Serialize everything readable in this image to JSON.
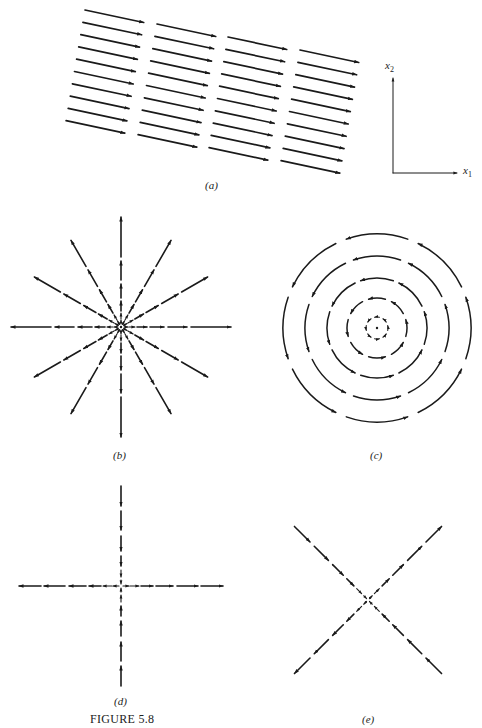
{
  "figure": {
    "title": "FIGURE 5.8",
    "ink_color": "#1a1a1a",
    "background": "#ffffff"
  },
  "chart_data": [
    {
      "type": "vector-field",
      "panel": "a",
      "caption": "(a)",
      "description": "Uniform parallel flow, constant direction slightly below horizontal pointing right",
      "field": "uniform",
      "direction_degrees_below_x1": 12,
      "columns": 4,
      "rows_per_column": 10
    },
    {
      "type": "axes-key",
      "panel": "a-axes",
      "x_label": "x",
      "x_sub": "1",
      "y_label": "x",
      "y_sub": "2"
    },
    {
      "type": "vector-field",
      "panel": "b",
      "caption": "(b)",
      "description": "Radial source: flow outward from origin",
      "field": "dx/dt = x, dy/dt = y",
      "rays": 12
    },
    {
      "type": "vector-field",
      "panel": "c",
      "caption": "(c)",
      "description": "Rotational (center) flow, counterclockwise concentric circles",
      "field": "dx/dt = -y, dy/dt = x",
      "rings": 5
    },
    {
      "type": "vector-field",
      "panel": "d",
      "caption": "(d)",
      "description": "Saddle: inflow along x2-axis, outflow along x1-axis",
      "field": "dx/dt = x, dy/dt = -y"
    },
    {
      "type": "vector-field",
      "panel": "e",
      "caption": "(e)",
      "description": "Saddle rotated 45 degrees: outflow along x1 = x2, inflow along x1 = -x2",
      "field": "dx/dt = y, dy/dt = x"
    }
  ]
}
